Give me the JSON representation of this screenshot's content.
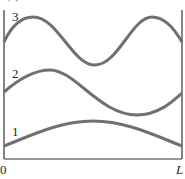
{
  "figure": {
    "partial_title": "(a)",
    "curve_labels": [
      "1",
      "2",
      "3"
    ],
    "x_axis": {
      "start_label": "0",
      "end_label": "L"
    },
    "curve_color": "#707070",
    "axis_color": "#333333"
  }
}
